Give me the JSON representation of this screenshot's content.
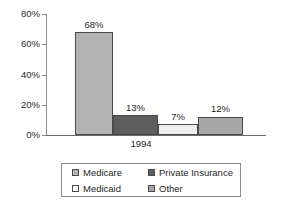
{
  "chart_data": {
    "type": "bar",
    "title": "",
    "subtitle": "",
    "xlabel": "",
    "ylabel": "",
    "categories": [
      "1994"
    ],
    "x_tick_labels": [
      "1994"
    ],
    "y_tick_labels": [
      "0%",
      "20%",
      "40%",
      "60%",
      "80%"
    ],
    "y_tick_values": [
      0,
      20,
      40,
      60,
      80
    ],
    "ylim": [
      0,
      80
    ],
    "grid": false,
    "legend_position": "bottom",
    "series": [
      {
        "name": "Medicare",
        "values": [
          68
        ],
        "data_label": "68%",
        "color": "#b3b3b3"
      },
      {
        "name": "Private Insurance",
        "values": [
          13
        ],
        "data_label": "13%",
        "color": "#5e5e5e"
      },
      {
        "name": "Medicaid",
        "values": [
          7
        ],
        "data_label": "7%",
        "color": "#ededed"
      },
      {
        "name": "Other",
        "values": [
          12
        ],
        "data_label": "12%",
        "color": "#a8a8a8"
      }
    ]
  },
  "legend": {
    "entries": [
      {
        "label": "Medicare",
        "color": "#b3b3b3"
      },
      {
        "label": "Private Insurance",
        "color": "#5e5e5e"
      },
      {
        "label": "Medicaid",
        "color": "#ffffff"
      },
      {
        "label": "Other",
        "color": "#a8a8a8"
      }
    ]
  },
  "axis": {
    "border_color": "#8a8a8a",
    "text_color": "#1f1f1f"
  }
}
